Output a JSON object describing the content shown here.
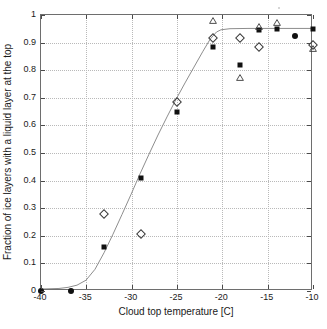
{
  "chart_data": {
    "type": "scatter",
    "title": "",
    "xlabel": "Cloud top temperature [C]",
    "ylabel": "Fraction of ice layers with a liquid layer at the top",
    "xlim": [
      -40,
      -10
    ],
    "ylim": [
      0,
      1
    ],
    "xticks": [
      -40,
      -35,
      -30,
      -25,
      -20,
      -15,
      -10
    ],
    "xticklabels": [
      "-40",
      "-35",
      "-30",
      "-25",
      "-20",
      "-15",
      "-10"
    ],
    "yticks": [
      0,
      0.1,
      0.2,
      0.3,
      0.4,
      0.5,
      0.6,
      0.7,
      0.8,
      0.9,
      1
    ],
    "yticklabels": [
      "0",
      "0.1",
      "0.2",
      "0.3",
      "0.4",
      "0.5",
      "0.6",
      "0.7",
      "0.8",
      "0.9",
      "1"
    ],
    "grid": true,
    "legend": "none",
    "series": [
      {
        "name": "filled-square",
        "marker": "square",
        "color": "#111111",
        "points": [
          {
            "x": -33.0,
            "y": 0.158
          },
          {
            "x": -29.0,
            "y": 0.408
          },
          {
            "x": -25.0,
            "y": 0.65
          },
          {
            "x": -21.0,
            "y": 0.885
          },
          {
            "x": -18.0,
            "y": 0.818
          },
          {
            "x": -16.0,
            "y": 0.945
          },
          {
            "x": -14.0,
            "y": 0.95
          },
          {
            "x": -10.0,
            "y": 0.95
          }
        ]
      },
      {
        "name": "filled-circle",
        "marker": "circle",
        "color": "#111111",
        "points": [
          {
            "x": -40.0,
            "y": 0.0
          },
          {
            "x": -36.7,
            "y": 0.0
          },
          {
            "x": -12.0,
            "y": 0.925
          }
        ]
      },
      {
        "name": "open-diamond",
        "marker": "diamond",
        "color": "#3a3a3a",
        "points": [
          {
            "x": -33.0,
            "y": 0.278
          },
          {
            "x": -29.0,
            "y": 0.207
          },
          {
            "x": -25.0,
            "y": 0.686
          },
          {
            "x": -21.0,
            "y": 0.915
          },
          {
            "x": -18.0,
            "y": 0.918
          },
          {
            "x": -16.0,
            "y": 0.885
          },
          {
            "x": -10.0,
            "y": 0.89
          }
        ]
      },
      {
        "name": "open-triangle",
        "marker": "triangle",
        "color": "#3a3a3a",
        "points": [
          {
            "x": -21.0,
            "y": 0.985
          },
          {
            "x": -18.0,
            "y": 0.778
          },
          {
            "x": -16.0,
            "y": 0.962
          },
          {
            "x": -14.0,
            "y": 0.98
          },
          {
            "x": -10.0,
            "y": 0.885
          }
        ]
      }
    ],
    "fit_curve": {
      "name": "sigmoid-fit",
      "color": "#8c8c8c",
      "points": [
        {
          "x": -40.0,
          "y": 0.0
        },
        {
          "x": -38.0,
          "y": 0.002
        },
        {
          "x": -37.0,
          "y": 0.006
        },
        {
          "x": -36.0,
          "y": 0.014
        },
        {
          "x": -35.0,
          "y": 0.032
        },
        {
          "x": -34.0,
          "y": 0.072
        },
        {
          "x": -33.0,
          "y": 0.132
        },
        {
          "x": -32.0,
          "y": 0.2
        },
        {
          "x": -31.0,
          "y": 0.272
        },
        {
          "x": -30.0,
          "y": 0.345
        },
        {
          "x": -29.0,
          "y": 0.42
        },
        {
          "x": -28.0,
          "y": 0.492
        },
        {
          "x": -27.0,
          "y": 0.562
        },
        {
          "x": -26.0,
          "y": 0.628
        },
        {
          "x": -25.0,
          "y": 0.692
        },
        {
          "x": -24.0,
          "y": 0.752
        },
        {
          "x": -23.0,
          "y": 0.81
        },
        {
          "x": -22.0,
          "y": 0.868
        },
        {
          "x": -21.2,
          "y": 0.912
        },
        {
          "x": -20.5,
          "y": 0.938
        },
        {
          "x": -20.0,
          "y": 0.946
        },
        {
          "x": -19.0,
          "y": 0.95
        },
        {
          "x": -17.0,
          "y": 0.951
        },
        {
          "x": -14.0,
          "y": 0.951
        },
        {
          "x": -10.0,
          "y": 0.951
        }
      ]
    }
  }
}
